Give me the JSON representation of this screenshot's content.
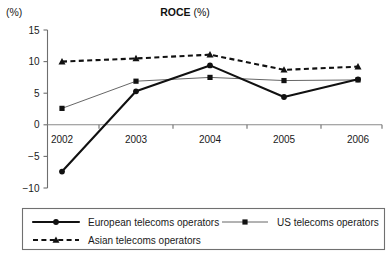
{
  "chart_data": {
    "type": "line",
    "title": "ROCE (%)",
    "title_bold_part": "ROCE",
    "title_unit_part": " (%)",
    "yaxis_unit_label": "(%)",
    "xlabel": "",
    "ylabel": "",
    "categories": [
      "2002",
      "2003",
      "2004",
      "2005",
      "2006"
    ],
    "ylim": [
      -10,
      15
    ],
    "yticks": [
      -10,
      -5,
      0,
      5,
      10,
      15
    ],
    "ytick_labels": [
      "−10",
      "−5",
      "0",
      "5",
      "10",
      "15"
    ],
    "grid": false,
    "legend_position": "bottom",
    "series": [
      {
        "name": "European telecoms operators",
        "marker": "circle",
        "line_style": "solid",
        "line_weight": "thick",
        "color": "#111111",
        "values": [
          -7.4,
          5.3,
          9.4,
          4.4,
          7.2
        ]
      },
      {
        "name": "US telecoms operators",
        "marker": "square",
        "line_style": "solid",
        "line_weight": "thin",
        "color": "#555555",
        "values": [
          2.6,
          6.9,
          7.5,
          7.0,
          7.1
        ]
      },
      {
        "name": "Asian telecoms operators",
        "marker": "triangle",
        "line_style": "dashed",
        "line_weight": "thick",
        "color": "#111111",
        "values": [
          10.0,
          10.5,
          11.1,
          8.7,
          9.2
        ]
      }
    ]
  },
  "legend": {
    "entries": [
      {
        "label": "European telecoms operators"
      },
      {
        "label": "US telecoms operators"
      },
      {
        "label": "Asian telecoms operators"
      }
    ]
  }
}
